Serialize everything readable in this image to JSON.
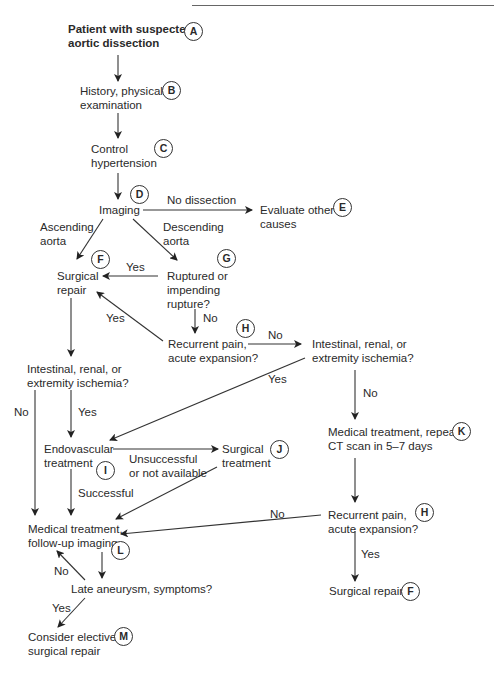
{
  "diagram": {
    "type": "flowchart",
    "title": "Patient with suspected aortic dissection",
    "nodes": [
      {
        "id": "A",
        "badge": "A",
        "line1": "Patient with suspected",
        "line2": "aortic dissection"
      },
      {
        "id": "B",
        "badge": "B",
        "line1": "History, physical",
        "line2": "examination"
      },
      {
        "id": "C",
        "badge": "C",
        "line1": "Control",
        "line2": "hypertension"
      },
      {
        "id": "D",
        "badge": "D",
        "line1": "Imaging"
      },
      {
        "id": "E",
        "badge": "E",
        "line1": "Evaluate other",
        "line2": "causes"
      },
      {
        "id": "F1",
        "badge": "F",
        "line1": "Surgical",
        "line2": "repair"
      },
      {
        "id": "G",
        "badge": "G",
        "line1": "Ruptured or",
        "line2": "impending",
        "line3": "rupture?"
      },
      {
        "id": "H1",
        "badge": "H",
        "line1": "Recurrent pain,",
        "line2": "acute expansion?"
      },
      {
        "id": "ISC1",
        "line1": "Intestinal, renal, or",
        "line2": "extremity ischemia?"
      },
      {
        "id": "ISC2",
        "line1": "Intestinal, renal, or",
        "line2": "extremity ischemia?"
      },
      {
        "id": "K",
        "badge": "K",
        "line1": "Medical treatment, repeat",
        "line2": "CT scan in 5–7 days"
      },
      {
        "id": "I",
        "badge": "I",
        "line1": "Endovascular",
        "line2": "treatment"
      },
      {
        "id": "J",
        "badge": "J",
        "line1": "Surgical",
        "line2": "treatment"
      },
      {
        "id": "H2",
        "badge": "H",
        "line1": "Recurrent pain,",
        "line2": "acute expansion?"
      },
      {
        "id": "L",
        "badge": "L",
        "line1": "Medical treatment,",
        "line2": "follow-up imaging"
      },
      {
        "id": "LA",
        "line1": "Late aneurysm, symptoms?"
      },
      {
        "id": "F2",
        "badge": "F",
        "line1": "Surgical repair"
      },
      {
        "id": "M",
        "badge": "M",
        "line1": "Consider elective",
        "line2": "surgical repair"
      }
    ],
    "edge_labels": {
      "no_dissection": "No dissection",
      "ascending_1": "Ascending",
      "ascending_2": "aorta",
      "descending_1": "Descending",
      "descending_2": "aorta",
      "g_yes": "Yes",
      "g_no": "No",
      "h1_yes": "Yes",
      "h1_no": "No",
      "isc1_no": "No",
      "isc1_yes": "Yes",
      "isc2_yes": "Yes",
      "isc2_no": "No",
      "unsuccessful_1": "Unsuccessful",
      "unsuccessful_2": "or not available",
      "successful": "Successful",
      "h2_no": "No",
      "h2_yes": "Yes",
      "la_no": "No",
      "la_yes": "Yes"
    },
    "edges": [
      {
        "from": "A",
        "to": "B"
      },
      {
        "from": "B",
        "to": "C"
      },
      {
        "from": "C",
        "to": "D"
      },
      {
        "from": "D",
        "to": "E",
        "label": "No dissection"
      },
      {
        "from": "D",
        "to": "F1",
        "label": "Ascending aorta"
      },
      {
        "from": "D",
        "to": "G",
        "label": "Descending aorta"
      },
      {
        "from": "G",
        "to": "F1",
        "label": "Yes"
      },
      {
        "from": "G",
        "to": "H1",
        "label": "No"
      },
      {
        "from": "H1",
        "to": "F1",
        "label": "Yes"
      },
      {
        "from": "H1",
        "to": "ISC2",
        "label": "No"
      },
      {
        "from": "F1",
        "to": "ISC1"
      },
      {
        "from": "ISC1",
        "to": "L",
        "label": "No"
      },
      {
        "from": "ISC1",
        "to": "I",
        "label": "Yes"
      },
      {
        "from": "ISC2",
        "to": "I",
        "label": "Yes"
      },
      {
        "from": "ISC2",
        "to": "K",
        "label": "No"
      },
      {
        "from": "I",
        "to": "J",
        "label": "Unsuccessful or not available"
      },
      {
        "from": "I",
        "to": "L",
        "label": "Successful"
      },
      {
        "from": "J",
        "to": "L"
      },
      {
        "from": "K",
        "to": "H2"
      },
      {
        "from": "H2",
        "to": "L",
        "label": "No"
      },
      {
        "from": "H2",
        "to": "F2",
        "label": "Yes"
      },
      {
        "from": "L",
        "to": "LA"
      },
      {
        "from": "LA",
        "to": "L",
        "label": "No"
      },
      {
        "from": "LA",
        "to": "M",
        "label": "Yes"
      }
    ]
  }
}
